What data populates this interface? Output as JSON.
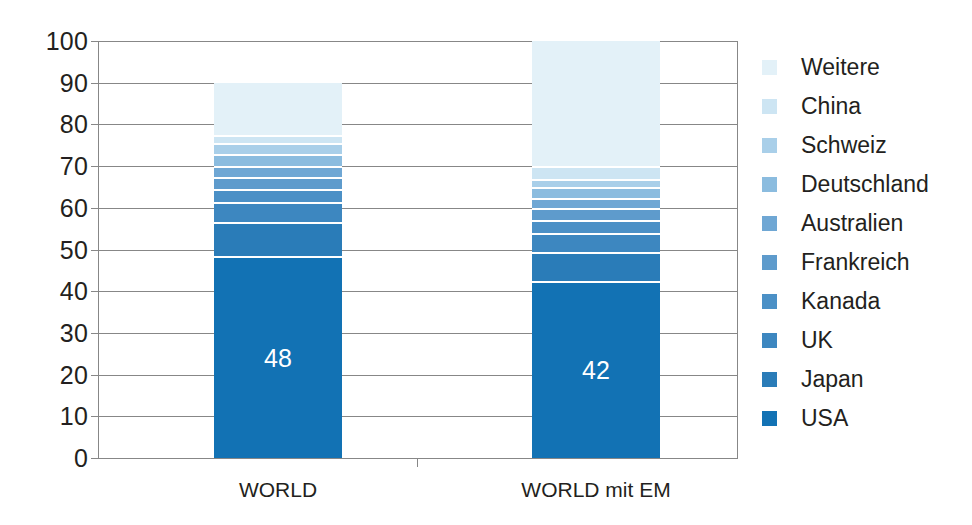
{
  "chart_data": {
    "type": "bar",
    "subtype": "stacked-bar-100",
    "title": "",
    "subtitle": "",
    "xlabel": "",
    "ylabel": "",
    "categories": [
      "WORLD",
      "WORLD mit EM"
    ],
    "ylim": [
      0,
      100
    ],
    "yticks": [
      0,
      10,
      20,
      30,
      40,
      50,
      60,
      70,
      80,
      90,
      100
    ],
    "ytick_labels": [
      "0",
      "10",
      "20",
      "30",
      "40",
      "50",
      "60",
      "70",
      "80",
      "90",
      "100"
    ],
    "grid": true,
    "legend_position": "right",
    "legend_order_top_to_bottom": [
      "Weitere",
      "China",
      "Schweiz",
      "Deutschland",
      "Australien",
      "Frankreich",
      "Kanada",
      "UK",
      "Japan",
      "USA"
    ],
    "stack_order_bottom_to_top": [
      "USA",
      "Japan",
      "UK",
      "Kanada",
      "Frankreich",
      "Australien",
      "Deutschland",
      "Schweiz",
      "China",
      "Weitere"
    ],
    "series": [
      {
        "name": "USA",
        "color": "#1272b4",
        "values": [
          48.0,
          42.0
        ]
      },
      {
        "name": "Japan",
        "color": "#2a7cb8",
        "values": [
          8.0,
          7.0
        ]
      },
      {
        "name": "UK",
        "color": "#3d87c0",
        "values": [
          5.0,
          4.5
        ]
      },
      {
        "name": "Kanada",
        "color": "#4b90c6",
        "values": [
          3.0,
          3.0
        ]
      },
      {
        "name": "Frankreich",
        "color": "#5e9bcc",
        "values": [
          3.0,
          3.0
        ]
      },
      {
        "name": "Australien",
        "color": "#6fa7d4",
        "values": [
          2.5,
          2.5
        ]
      },
      {
        "name": "Deutschland",
        "color": "#8bbcdf",
        "values": [
          3.0,
          2.5
        ]
      },
      {
        "name": "Schweiz",
        "color": "#a9cfe9",
        "values": [
          2.5,
          2.0
        ]
      },
      {
        "name": "China",
        "color": "#cde5f3",
        "values": [
          2.0,
          3.0
        ]
      },
      {
        "name": "Weitere",
        "color": "#e3f1f8",
        "values": [
          13.0,
          30.5
        ]
      }
    ],
    "data_labels": [
      {
        "category": "WORLD",
        "series": "USA",
        "text": "48"
      },
      {
        "category": "WORLD mit EM",
        "series": "USA",
        "text": "42"
      }
    ],
    "axis_color": "#878787",
    "text_color": "#231f20",
    "background": "#ffffff"
  }
}
